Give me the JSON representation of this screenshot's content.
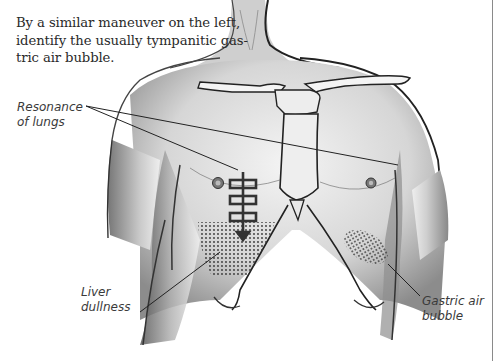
{
  "caption": {
    "lines": [
      "By a similar maneuver on the left,",
      "identify the usually tympanitic gas-",
      "tric air bubble."
    ]
  },
  "figure": {
    "labels": {
      "lungs": {
        "lines": [
          "Resonance",
          "of lungs"
        ]
      },
      "liver": {
        "lines": [
          "Liver",
          "dullness"
        ]
      },
      "gastric": {
        "lines": [
          "Gastric air",
          "bubble"
        ]
      }
    },
    "icons": {
      "percussion_marker": "percussion-ladder-arrow-icon",
      "liver_region": "stippled-dullness-area",
      "gastric_region": "stippled-gastric-area"
    }
  },
  "colors": {
    "ink": "#2a2a2a",
    "skin_shade": "#9a9a9a",
    "stipple": "#333333",
    "border_rule": "#8a8a8a"
  }
}
